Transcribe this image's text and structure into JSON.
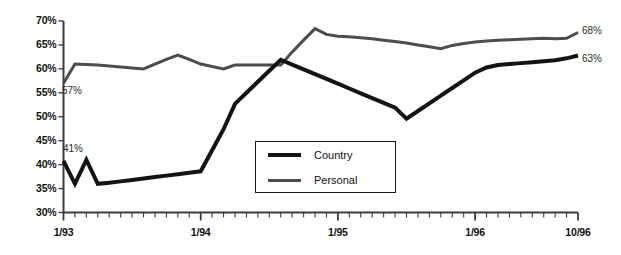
{
  "chart_data": {
    "type": "line",
    "title": "",
    "xlabel": "",
    "ylabel": "",
    "ylim": [
      30,
      70
    ],
    "ytick_values": [
      30,
      35,
      40,
      45,
      50,
      55,
      60,
      65,
      70
    ],
    "ytick_labels": [
      "30%",
      "35%",
      "40%",
      "45%",
      "50%",
      "55%",
      "60%",
      "65%",
      "70%"
    ],
    "xlim": [
      0,
      45
    ],
    "xtick_labels": [
      "1/93",
      "1/94",
      "1/95",
      "1/96",
      "10/96"
    ],
    "xtick_positions": [
      0,
      12,
      24,
      36,
      45
    ],
    "x_minor_ticks_every": 1,
    "grid": false,
    "legend_position": "center",
    "x": [
      0,
      1,
      2,
      3,
      4,
      5,
      6,
      7,
      8,
      9,
      10,
      11,
      12,
      13,
      14,
      15,
      16,
      17,
      18,
      19,
      20,
      21,
      22,
      23,
      24,
      25,
      26,
      27,
      28,
      29,
      30,
      31,
      32,
      33,
      34,
      35,
      36,
      37,
      38,
      39,
      40,
      41,
      42,
      43,
      44,
      45
    ],
    "series": [
      {
        "name": "Country",
        "color": "#141414",
        "line_width": 4.0,
        "values": [
          40.8,
          36.0,
          41.0,
          36.0,
          36.2,
          36.5,
          36.8,
          37.1,
          37.4,
          37.7,
          38.0,
          38.3,
          38.6,
          43.0,
          47.4,
          52.7,
          55.0,
          57.3,
          59.6,
          61.9,
          60.9,
          59.9,
          58.9,
          57.9,
          56.9,
          55.9,
          54.9,
          53.9,
          52.9,
          51.9,
          49.6,
          51.2,
          52.8,
          54.4,
          56.0,
          57.6,
          59.2,
          60.3,
          60.8,
          61.0,
          61.2,
          61.4,
          61.6,
          61.8,
          62.2,
          62.8
        ]
      },
      {
        "name": "Personal",
        "color": "#4d4d4d",
        "line_width": 3.0,
        "values": [
          57.0,
          61.0,
          60.9,
          60.8,
          60.6,
          60.4,
          60.2,
          60.0,
          61.0,
          62.0,
          62.9,
          62.0,
          61.0,
          60.5,
          60.0,
          60.8,
          60.8,
          60.8,
          60.8,
          60.8,
          63.5,
          66.0,
          68.4,
          67.2,
          66.8,
          66.7,
          66.5,
          66.3,
          66.0,
          65.7,
          65.4,
          65.0,
          64.6,
          64.2,
          64.9,
          65.3,
          65.6,
          65.8,
          66.0,
          66.1,
          66.2,
          66.3,
          66.4,
          66.3,
          66.4,
          67.6
        ]
      }
    ],
    "annotations": [
      {
        "text": "57%",
        "series": "Personal",
        "value": 57,
        "x": 0,
        "placement": "below-start"
      },
      {
        "text": "41%",
        "series": "Country",
        "value": 41,
        "x": 2,
        "placement": "above-start"
      },
      {
        "text": "68%",
        "series": "Personal",
        "value": 68,
        "x": 45,
        "placement": "right-end"
      },
      {
        "text": "63%",
        "series": "Country",
        "value": 63,
        "x": 45,
        "placement": "right-end"
      }
    ],
    "legend": [
      {
        "label": "Country",
        "color": "#141414"
      },
      {
        "label": "Personal",
        "color": "#4d4d4d"
      }
    ]
  },
  "axis": {
    "axis_color": "#3d3d3d"
  }
}
